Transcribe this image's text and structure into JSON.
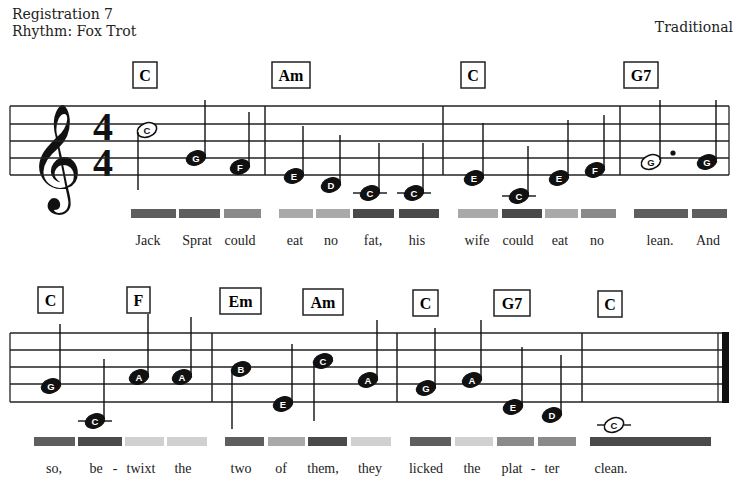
{
  "header": {
    "registration": "Registration 7",
    "rhythm": "Rhythm: Fox Trot",
    "composer": "Traditional"
  },
  "time_signature": {
    "top": "4",
    "bottom": "4"
  },
  "clef": "treble-clef",
  "colors": {
    "dark": "#4a4a4a",
    "medium_dark": "#5e5e5e",
    "medium": "#8a8a8a",
    "light": "#a9a9a9",
    "very_light": "#d0d0d0"
  },
  "staves": [
    {
      "lines_y": [
        106,
        124,
        141,
        158,
        175
      ],
      "x_start": 10,
      "x_end": 729,
      "barlines": [
        265,
        443,
        620
      ],
      "final_barline": false,
      "chords": [
        {
          "label": "C",
          "x": 133,
          "y": 62,
          "w": 24
        },
        {
          "label": "Am",
          "x": 272,
          "y": 62,
          "w": 38
        },
        {
          "label": "C",
          "x": 461,
          "y": 62,
          "w": 24
        },
        {
          "label": "G7",
          "x": 624,
          "y": 62,
          "w": 34
        }
      ],
      "notes": [
        {
          "name": "C",
          "x": 147,
          "y": 130,
          "filled": false,
          "stem": "down",
          "stem_len": 60
        },
        {
          "name": "G",
          "x": 196,
          "y": 158,
          "filled": true,
          "stem": "up",
          "stem_len": 58
        },
        {
          "name": "F",
          "x": 240,
          "y": 167,
          "filled": true,
          "stem": "up",
          "stem_len": 55
        },
        {
          "name": "E",
          "x": 294,
          "y": 176,
          "filled": true,
          "stem": "up",
          "stem_len": 50
        },
        {
          "name": "D",
          "x": 331,
          "y": 185,
          "filled": true,
          "stem": "up",
          "stem_len": 50
        },
        {
          "name": "C",
          "x": 370,
          "y": 193,
          "filled": true,
          "stem": "up",
          "stem_len": 50,
          "ledger": true
        },
        {
          "name": "C",
          "x": 414,
          "y": 193,
          "filled": true,
          "stem": "up",
          "stem_len": 50,
          "ledger": true
        },
        {
          "name": "E",
          "x": 474,
          "y": 178,
          "filled": true,
          "stem": "up",
          "stem_len": 55
        },
        {
          "name": "C",
          "x": 519,
          "y": 196,
          "filled": true,
          "stem": "up",
          "stem_len": 50,
          "ledger": true
        },
        {
          "name": "E",
          "x": 559,
          "y": 178,
          "filled": true,
          "stem": "up",
          "stem_len": 58
        },
        {
          "name": "F",
          "x": 595,
          "y": 170,
          "filled": true,
          "stem": "up",
          "stem_len": 55
        },
        {
          "name": "G",
          "x": 651,
          "y": 162,
          "filled": false,
          "stem": "up",
          "stem_len": 62,
          "dotted": true
        },
        {
          "name": "G",
          "x": 707,
          "y": 162,
          "filled": true,
          "stem": "up",
          "stem_len": 62
        }
      ],
      "color_bars": [
        {
          "x": 131,
          "w": 45,
          "color": "#5e5e5e"
        },
        {
          "x": 179,
          "w": 41,
          "color": "#5e5e5e"
        },
        {
          "x": 224,
          "w": 37,
          "color": "#8a8a8a"
        },
        {
          "x": 279,
          "w": 34,
          "color": "#a9a9a9"
        },
        {
          "x": 316,
          "w": 34,
          "color": "#a9a9a9"
        },
        {
          "x": 353,
          "w": 41,
          "color": "#4a4a4a"
        },
        {
          "x": 399,
          "w": 40,
          "color": "#4a4a4a"
        },
        {
          "x": 458,
          "w": 40,
          "color": "#a9a9a9"
        },
        {
          "x": 502,
          "w": 40,
          "color": "#4a4a4a"
        },
        {
          "x": 545,
          "w": 33,
          "color": "#a9a9a9"
        },
        {
          "x": 581,
          "w": 35,
          "color": "#8a8a8a"
        },
        {
          "x": 634,
          "w": 54,
          "color": "#5e5e5e"
        },
        {
          "x": 692,
          "w": 35,
          "color": "#5e5e5e"
        }
      ],
      "bars_y": 209,
      "lyrics_y": 245,
      "lyrics": [
        {
          "text": "Jack",
          "x": 148
        },
        {
          "text": "Sprat",
          "x": 197
        },
        {
          "text": "could",
          "x": 240
        },
        {
          "text": "eat",
          "x": 295
        },
        {
          "text": "no",
          "x": 331
        },
        {
          "text": "fat,",
          "x": 373
        },
        {
          "text": "his",
          "x": 417
        },
        {
          "text": "wife",
          "x": 477
        },
        {
          "text": "could",
          "x": 518
        },
        {
          "text": "eat",
          "x": 560
        },
        {
          "text": "no",
          "x": 597
        },
        {
          "text": "lean.",
          "x": 660
        },
        {
          "text": "And",
          "x": 708
        }
      ]
    },
    {
      "lines_y": [
        333,
        350,
        367,
        384,
        402
      ],
      "x_start": 10,
      "x_end": 729,
      "barlines": [
        212,
        397,
        582
      ],
      "final_barline": true,
      "chords": [
        {
          "label": "C",
          "x": 38,
          "y": 287,
          "w": 25
        },
        {
          "label": "F",
          "x": 127,
          "y": 287,
          "w": 23
        },
        {
          "label": "Em",
          "x": 220,
          "y": 288,
          "w": 41
        },
        {
          "label": "Am",
          "x": 303,
          "y": 289,
          "w": 40
        },
        {
          "label": "C",
          "x": 413,
          "y": 290,
          "w": 25
        },
        {
          "label": "G7",
          "x": 494,
          "y": 290,
          "w": 36
        },
        {
          "label": "C",
          "x": 598,
          "y": 291,
          "w": 24
        }
      ],
      "notes": [
        {
          "name": "G",
          "x": 51,
          "y": 386,
          "filled": true,
          "stem": "up",
          "stem_len": 62
        },
        {
          "name": "C",
          "x": 95,
          "y": 421,
          "filled": true,
          "stem": "up",
          "stem_len": 62,
          "ledger": true
        },
        {
          "name": "A",
          "x": 139,
          "y": 377,
          "filled": true,
          "stem": "up",
          "stem_len": 63
        },
        {
          "name": "A",
          "x": 182,
          "y": 377,
          "filled": true,
          "stem": "up",
          "stem_len": 60
        },
        {
          "name": "B",
          "x": 241,
          "y": 369,
          "filled": true,
          "stem": "down",
          "stem_len": 60
        },
        {
          "name": "E",
          "x": 283,
          "y": 404,
          "filled": true,
          "stem": "up",
          "stem_len": 60
        },
        {
          "name": "C",
          "x": 323,
          "y": 361,
          "filled": true,
          "stem": "down",
          "stem_len": 60
        },
        {
          "name": "A",
          "x": 368,
          "y": 380,
          "filled": true,
          "stem": "up",
          "stem_len": 60
        },
        {
          "name": "G",
          "x": 426,
          "y": 388,
          "filled": true,
          "stem": "up",
          "stem_len": 60
        },
        {
          "name": "A",
          "x": 472,
          "y": 380,
          "filled": true,
          "stem": "up",
          "stem_len": 60
        },
        {
          "name": "E",
          "x": 513,
          "y": 407,
          "filled": true,
          "stem": "up",
          "stem_len": 60
        },
        {
          "name": "D",
          "x": 552,
          "y": 415,
          "filled": true,
          "stem": "up",
          "stem_len": 60
        },
        {
          "name": "C",
          "x": 614,
          "y": 425,
          "filled": false,
          "stem": "none",
          "stem_len": 0,
          "ledger": true
        }
      ],
      "color_bars": [
        {
          "x": 34,
          "w": 41,
          "color": "#5e5e5e"
        },
        {
          "x": 78,
          "w": 44,
          "color": "#4a4a4a"
        },
        {
          "x": 125,
          "w": 39,
          "color": "#d0d0d0"
        },
        {
          "x": 167,
          "w": 40,
          "color": "#d0d0d0"
        },
        {
          "x": 225,
          "w": 39,
          "color": "#5e5e5e"
        },
        {
          "x": 268,
          "w": 37,
          "color": "#a9a9a9"
        },
        {
          "x": 308,
          "w": 39,
          "color": "#4a4a4a"
        },
        {
          "x": 351,
          "w": 40,
          "color": "#d0d0d0"
        },
        {
          "x": 410,
          "w": 41,
          "color": "#5e5e5e"
        },
        {
          "x": 455,
          "w": 38,
          "color": "#d0d0d0"
        },
        {
          "x": 497,
          "w": 37,
          "color": "#8a8a8a"
        },
        {
          "x": 538,
          "w": 38,
          "color": "#8a8a8a"
        },
        {
          "x": 590,
          "w": 121,
          "color": "#4a4a4a"
        }
      ],
      "bars_y": 437,
      "lyrics_y": 473,
      "lyrics": [
        {
          "text": "so,",
          "x": 54
        },
        {
          "text": "be",
          "x": 96
        },
        {
          "text": "-",
          "x": 115
        },
        {
          "text": "twixt",
          "x": 141
        },
        {
          "text": "the",
          "x": 183
        },
        {
          "text": "two",
          "x": 241
        },
        {
          "text": "of",
          "x": 281
        },
        {
          "text": "them,",
          "x": 323
        },
        {
          "text": "they",
          "x": 370
        },
        {
          "text": "licked",
          "x": 426
        },
        {
          "text": "the",
          "x": 472
        },
        {
          "text": "plat",
          "x": 512
        },
        {
          "text": "-",
          "x": 533
        },
        {
          "text": "ter",
          "x": 552
        },
        {
          "text": "clean.",
          "x": 611
        }
      ]
    }
  ]
}
